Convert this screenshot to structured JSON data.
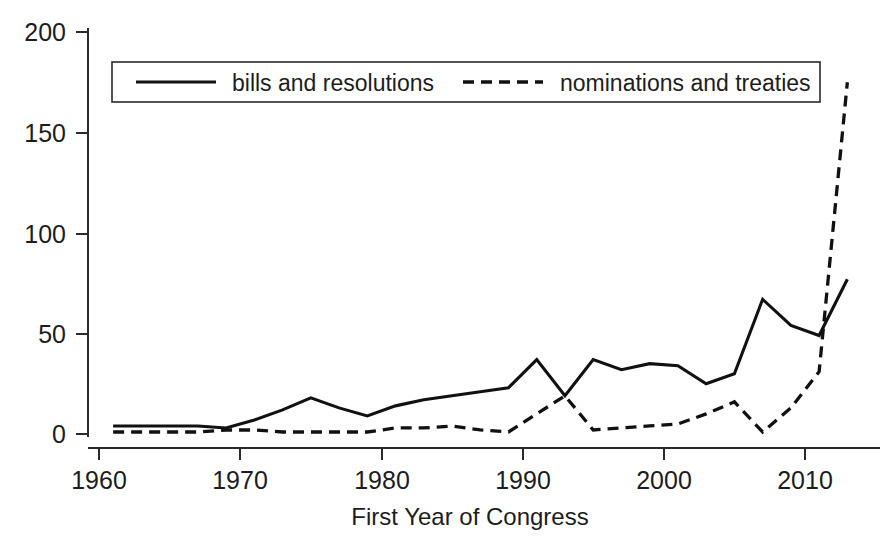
{
  "chart_data": {
    "type": "line",
    "title": "",
    "subtitle": "",
    "xlabel": "First Year of Congress",
    "ylabel": "",
    "xlim": [
      1960,
      2014
    ],
    "ylim": [
      0,
      200
    ],
    "grid": false,
    "legend_position": "top-left-inside",
    "xticks": [
      "1960",
      "1970",
      "1980",
      "1990",
      "2000",
      "2010"
    ],
    "xtick_values": [
      1960,
      1970,
      1980,
      1990,
      2000,
      2010
    ],
    "yticks": [
      "0",
      "50",
      "100",
      "150",
      "200"
    ],
    "ytick_values": [
      0,
      50,
      100,
      150,
      200
    ],
    "x": [
      1961,
      1963,
      1965,
      1967,
      1969,
      1971,
      1973,
      1975,
      1977,
      1979,
      1981,
      1983,
      1985,
      1987,
      1989,
      1991,
      1993,
      1995,
      1997,
      1999,
      2001,
      2003,
      2005,
      2007,
      2009,
      2011,
      2013
    ],
    "series": [
      {
        "name": "bills and resolutions",
        "style": "solid",
        "values": [
          4,
          4,
          4,
          4,
          3,
          7,
          12,
          18,
          13,
          9,
          14,
          17,
          19,
          21,
          23,
          37,
          19,
          37,
          32,
          35,
          34,
          25,
          30,
          67,
          54,
          49,
          77
        ]
      },
      {
        "name": "nominations and treaties",
        "style": "dashed",
        "values": [
          1,
          1,
          1,
          1,
          2,
          2,
          1,
          1,
          1,
          1,
          3,
          3,
          4,
          2,
          1,
          10,
          19,
          2,
          3,
          4,
          5,
          10,
          16,
          1,
          13,
          31,
          175
        ]
      }
    ]
  },
  "legend": {
    "items": [
      {
        "label": "bills and resolutions",
        "style": "solid"
      },
      {
        "label": "nominations and treaties",
        "style": "dashed"
      }
    ]
  },
  "colors": {
    "series_line": "#111111",
    "axis": "#2a2a2a",
    "text": "#1d1d1d",
    "background": "#ffffff"
  }
}
